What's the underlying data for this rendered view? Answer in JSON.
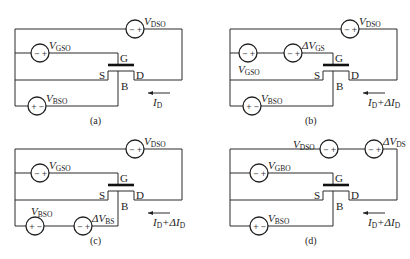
{
  "figure": {
    "panels": [
      {
        "id": "a",
        "caption": "(a)",
        "ox": 0,
        "oy": 0,
        "terminals": {
          "gate": "G",
          "source": "S",
          "drain": "D",
          "body": "B"
        },
        "current_label": {
          "main": "I",
          "sub": "D",
          "suffix": ""
        },
        "sources": [
          {
            "name": "V",
            "sub": "DSO",
            "cx": 135,
            "cy": 29,
            "left": "−",
            "right": "+",
            "label_pos": "above-right"
          },
          {
            "name": "V",
            "sub": "GSO",
            "cx": 40,
            "cy": 53,
            "left": "−",
            "right": "+",
            "label_pos": "above-right"
          },
          {
            "name": "V",
            "sub": "BSO",
            "cx": 37,
            "cy": 106,
            "left": "+",
            "right": "−",
            "label_pos": "above-right"
          }
        ]
      },
      {
        "id": "b",
        "caption": "(b)",
        "ox": 215,
        "oy": 0,
        "terminals": {
          "gate": "G",
          "source": "S",
          "drain": "D",
          "body": "B"
        },
        "current_label": {
          "main": "I",
          "sub": "D",
          "suffix": "+ΔI",
          "suffix_sub": "D"
        },
        "sources": [
          {
            "name": "V",
            "sub": "DSO",
            "cx": 135,
            "cy": 29,
            "left": "−",
            "right": "+",
            "label_pos": "above-right"
          },
          {
            "name": "V",
            "sub": "GSO",
            "cx": 33,
            "cy": 53,
            "left": "−",
            "right": "+",
            "label_pos": "below-left"
          },
          {
            "name": "ΔV",
            "sub": "GS",
            "cx": 78,
            "cy": 53,
            "left": "−",
            "right": "+",
            "label_pos": "above-right"
          },
          {
            "name": "V",
            "sub": "BSO",
            "cx": 37,
            "cy": 106,
            "left": "+",
            "right": "−",
            "label_pos": "above-right"
          }
        ]
      },
      {
        "id": "c",
        "caption": "(c)",
        "ox": 0,
        "oy": 129,
        "terminals": {
          "gate": "G",
          "source": "S",
          "drain": "D",
          "body": "B"
        },
        "current_label": {
          "main": "I",
          "sub": "D",
          "suffix": "+ΔI",
          "suffix_sub": "D"
        },
        "sources": [
          {
            "name": "V",
            "sub": "DSO",
            "cx": 135,
            "cy": 20,
            "left": "−",
            "right": "+",
            "label_pos": "above-right"
          },
          {
            "name": "V",
            "sub": "GSO",
            "cx": 40,
            "cy": 44,
            "left": "−",
            "right": "+",
            "label_pos": "above-right"
          },
          {
            "name": "V",
            "sub": "BSO",
            "cx": 35,
            "cy": 97,
            "left": "+",
            "right": "−",
            "label_pos": "above"
          },
          {
            "name": "ΔV",
            "sub": "BS",
            "cx": 83,
            "cy": 97,
            "left": "−",
            "right": "+",
            "label_pos": "above-right"
          }
        ]
      },
      {
        "id": "d",
        "caption": "(d)",
        "ox": 215,
        "oy": 129,
        "terminals": {
          "gate": "G",
          "source": "S",
          "drain": "D",
          "body": "B"
        },
        "current_label": {
          "main": "I",
          "sub": "D",
          "suffix": "+ΔI",
          "suffix_sub": "D"
        },
        "sources": [
          {
            "name": "V",
            "sub": "DSO",
            "cx": 114,
            "cy": 20,
            "left": "−",
            "right": "+",
            "label_pos": "above-left"
          },
          {
            "name": "ΔV",
            "sub": "DS",
            "cx": 159,
            "cy": 20,
            "left": "−",
            "right": "+",
            "label_pos": "above-right"
          },
          {
            "name": "V",
            "sub": "GBO",
            "cx": 44,
            "cy": 44,
            "left": "−",
            "right": "+",
            "label_pos": "above-right"
          },
          {
            "name": "V",
            "sub": "BSO",
            "cx": 44,
            "cy": 97,
            "left": "+",
            "right": "−",
            "label_pos": "above-right"
          }
        ]
      }
    ]
  }
}
